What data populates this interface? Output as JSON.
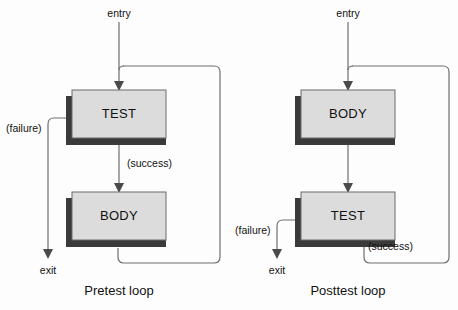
{
  "figure": {
    "background_color": "#fdfdfd",
    "box_fill": "#dcdcdc",
    "box_border": "#6b6b6b",
    "box_shadow": "#3a3a3a",
    "line_color": "#6f6f6f",
    "text_color": "#111111"
  },
  "diagrams": [
    {
      "id": "pretest",
      "caption": "Pretest loop",
      "entry_label": "entry",
      "exit_label": "exit",
      "boxes": [
        {
          "label": "TEST"
        },
        {
          "label": "BODY"
        }
      ],
      "edge_labels": {
        "failure": "(failure)",
        "success": "(success)"
      }
    },
    {
      "id": "posttest",
      "caption": "Posttest loop",
      "entry_label": "entry",
      "exit_label": "exit",
      "boxes": [
        {
          "label": "BODY"
        },
        {
          "label": "TEST"
        }
      ],
      "edge_labels": {
        "failure": "(failure)",
        "success": "(success)"
      }
    }
  ]
}
